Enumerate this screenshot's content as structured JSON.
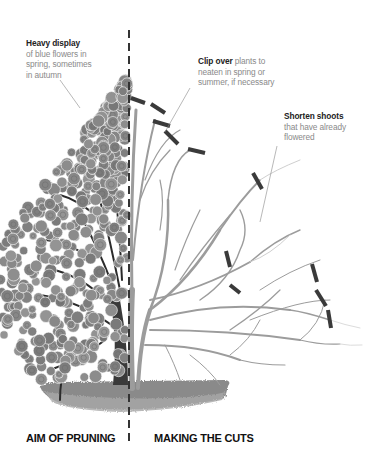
{
  "diagram": {
    "type": "pruning-illustration",
    "palette": {
      "text_bold": "#222222",
      "text_light": "#8a8a8a",
      "foliage": "#8c8c8c",
      "flower": "#7a7a7a",
      "branch_dark": "#2a2a2a",
      "branch_light": "#9a9a9a",
      "cut_mark": "#3a3a3a",
      "ground": "#7f7f7f",
      "divider": "#333333"
    }
  },
  "annotations": {
    "heavy_display": {
      "bold": "Heavy display",
      "text_lines": [
        "of blue flowers in",
        "spring, sometimes",
        "in autumn"
      ]
    },
    "clip_over": {
      "bold": "Clip over",
      "line1_rest": " plants to",
      "text_lines": [
        "neaten in spring or",
        "summer, if necessary"
      ]
    },
    "shorten_shoots": {
      "bold": "Shorten shoots",
      "text_lines": [
        "that have already",
        "flowered"
      ]
    }
  },
  "labels": {
    "left": "AIM OF PRUNING",
    "right": "MAKING THE CUTS"
  }
}
